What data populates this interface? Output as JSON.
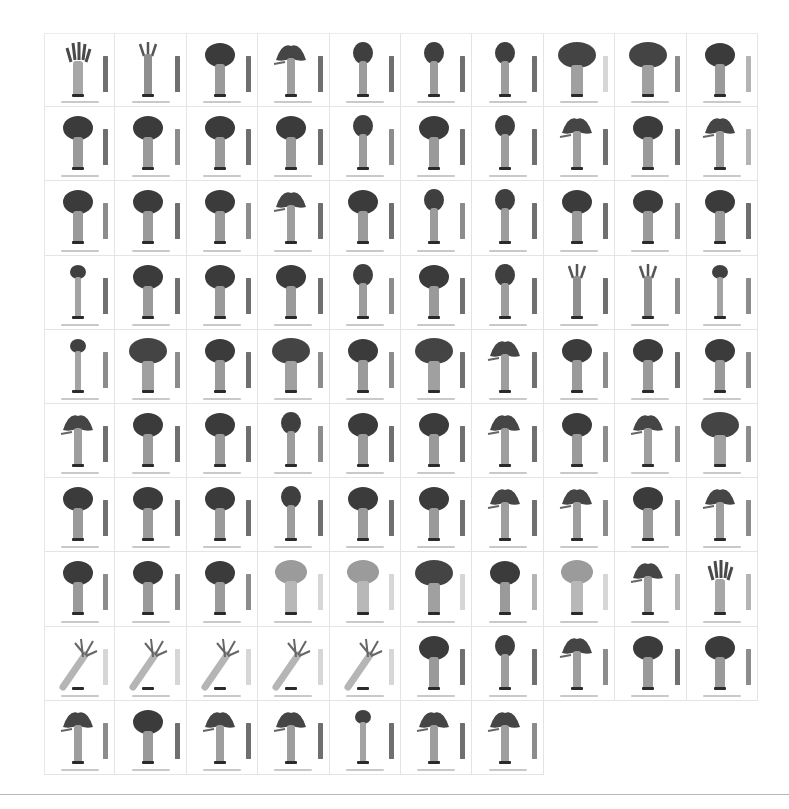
{
  "figure": {
    "layout": {
      "columns": 10,
      "rows": 10,
      "specimen_count": 97
    },
    "bar_shades": {
      "dark": "#6f6f6f",
      "mid": "#8c8c8c",
      "light": "#b4b4b4",
      "pale": "#d6d6d6"
    },
    "specimens": [
      {
        "shape": "fingered",
        "bar": "dark",
        "caption": ""
      },
      {
        "shape": "sparse",
        "bar": "dark",
        "caption": ""
      },
      {
        "shape": "dense",
        "bar": "dark",
        "caption": ""
      },
      {
        "shape": "leafy",
        "bar": "dark",
        "caption": ""
      },
      {
        "shape": "narrow",
        "bar": "dark",
        "caption": ""
      },
      {
        "shape": "narrow",
        "bar": "dark",
        "caption": ""
      },
      {
        "shape": "narrow",
        "bar": "dark",
        "caption": ""
      },
      {
        "shape": "wide",
        "bar": "pale",
        "caption": ""
      },
      {
        "shape": "wide",
        "bar": "mid",
        "caption": ""
      },
      {
        "shape": "dense",
        "bar": "light",
        "caption": ""
      },
      {
        "shape": "dense",
        "bar": "dark",
        "caption": ""
      },
      {
        "shape": "dense",
        "bar": "mid",
        "caption": ""
      },
      {
        "shape": "dense",
        "bar": "dark",
        "caption": ""
      },
      {
        "shape": "dense",
        "bar": "dark",
        "caption": ""
      },
      {
        "shape": "narrow",
        "bar": "mid",
        "caption": ""
      },
      {
        "shape": "dense",
        "bar": "dark",
        "caption": ""
      },
      {
        "shape": "narrow",
        "bar": "dark",
        "caption": ""
      },
      {
        "shape": "leafy",
        "bar": "dark",
        "caption": ""
      },
      {
        "shape": "dense",
        "bar": "dark",
        "caption": ""
      },
      {
        "shape": "leafy",
        "bar": "light",
        "caption": ""
      },
      {
        "shape": "dense",
        "bar": "mid",
        "caption": ""
      },
      {
        "shape": "dense",
        "bar": "dark",
        "caption": ""
      },
      {
        "shape": "dense",
        "bar": "mid",
        "caption": ""
      },
      {
        "shape": "leafy",
        "bar": "dark",
        "caption": ""
      },
      {
        "shape": "dense",
        "bar": "dark",
        "caption": ""
      },
      {
        "shape": "narrow",
        "bar": "mid",
        "caption": ""
      },
      {
        "shape": "narrow",
        "bar": "dark",
        "caption": ""
      },
      {
        "shape": "dense",
        "bar": "dark",
        "caption": ""
      },
      {
        "shape": "dense",
        "bar": "mid",
        "caption": ""
      },
      {
        "shape": "dense",
        "bar": "dark",
        "caption": ""
      },
      {
        "shape": "small",
        "bar": "dark",
        "caption": ""
      },
      {
        "shape": "dense",
        "bar": "dark",
        "caption": ""
      },
      {
        "shape": "dense",
        "bar": "dark",
        "caption": ""
      },
      {
        "shape": "dense",
        "bar": "dark",
        "caption": ""
      },
      {
        "shape": "narrow",
        "bar": "mid",
        "caption": ""
      },
      {
        "shape": "dense",
        "bar": "dark",
        "caption": ""
      },
      {
        "shape": "narrow",
        "bar": "dark",
        "caption": ""
      },
      {
        "shape": "sparse",
        "bar": "dark",
        "caption": ""
      },
      {
        "shape": "sparse",
        "bar": "mid",
        "caption": ""
      },
      {
        "shape": "small",
        "bar": "mid",
        "caption": ""
      },
      {
        "shape": "small",
        "bar": "mid",
        "caption": ""
      },
      {
        "shape": "wide",
        "bar": "mid",
        "caption": ""
      },
      {
        "shape": "dense",
        "bar": "dark",
        "caption": ""
      },
      {
        "shape": "wide",
        "bar": "mid",
        "caption": ""
      },
      {
        "shape": "dense",
        "bar": "mid",
        "caption": ""
      },
      {
        "shape": "wide",
        "bar": "dark",
        "caption": ""
      },
      {
        "shape": "leafy",
        "bar": "dark",
        "caption": ""
      },
      {
        "shape": "dense",
        "bar": "mid",
        "caption": ""
      },
      {
        "shape": "dense",
        "bar": "dark",
        "caption": ""
      },
      {
        "shape": "dense",
        "bar": "mid",
        "caption": ""
      },
      {
        "shape": "leafy",
        "bar": "dark",
        "caption": ""
      },
      {
        "shape": "dense",
        "bar": "dark",
        "caption": ""
      },
      {
        "shape": "dense",
        "bar": "dark",
        "caption": ""
      },
      {
        "shape": "narrow",
        "bar": "mid",
        "caption": ""
      },
      {
        "shape": "dense",
        "bar": "dark",
        "caption": ""
      },
      {
        "shape": "dense",
        "bar": "dark",
        "caption": ""
      },
      {
        "shape": "leafy",
        "bar": "dark",
        "caption": ""
      },
      {
        "shape": "dense",
        "bar": "mid",
        "caption": ""
      },
      {
        "shape": "leafy",
        "bar": "mid",
        "caption": ""
      },
      {
        "shape": "wide",
        "bar": "mid",
        "caption": ""
      },
      {
        "shape": "dense",
        "bar": "dark",
        "caption": ""
      },
      {
        "shape": "dense",
        "bar": "dark",
        "caption": ""
      },
      {
        "shape": "dense",
        "bar": "dark",
        "caption": ""
      },
      {
        "shape": "narrow",
        "bar": "dark",
        "caption": ""
      },
      {
        "shape": "dense",
        "bar": "dark",
        "caption": ""
      },
      {
        "shape": "dense",
        "bar": "dark",
        "caption": ""
      },
      {
        "shape": "leafy",
        "bar": "dark",
        "caption": ""
      },
      {
        "shape": "leafy",
        "bar": "mid",
        "caption": ""
      },
      {
        "shape": "dense",
        "bar": "mid",
        "caption": ""
      },
      {
        "shape": "leafy",
        "bar": "mid",
        "caption": ""
      },
      {
        "shape": "dense",
        "bar": "mid",
        "caption": ""
      },
      {
        "shape": "dense",
        "bar": "mid",
        "caption": ""
      },
      {
        "shape": "dense",
        "bar": "mid",
        "caption": ""
      },
      {
        "shape": "pale",
        "bar": "pale",
        "caption": ""
      },
      {
        "shape": "pale",
        "bar": "pale",
        "caption": ""
      },
      {
        "shape": "wide",
        "bar": "pale",
        "caption": ""
      },
      {
        "shape": "dense",
        "bar": "light",
        "caption": ""
      },
      {
        "shape": "pale",
        "bar": "pale",
        "caption": ""
      },
      {
        "shape": "leafy",
        "bar": "light",
        "caption": ""
      },
      {
        "shape": "fingered",
        "bar": "light",
        "caption": ""
      },
      {
        "shape": "stalky",
        "bar": "pale",
        "caption": ""
      },
      {
        "shape": "stalky",
        "bar": "pale",
        "caption": ""
      },
      {
        "shape": "stalky",
        "bar": "pale",
        "caption": ""
      },
      {
        "shape": "stalky",
        "bar": "pale",
        "caption": ""
      },
      {
        "shape": "stalky",
        "bar": "pale",
        "caption": ""
      },
      {
        "shape": "dense",
        "bar": "dark",
        "caption": ""
      },
      {
        "shape": "narrow",
        "bar": "dark",
        "caption": ""
      },
      {
        "shape": "leafy",
        "bar": "mid",
        "caption": ""
      },
      {
        "shape": "dense",
        "bar": "dark",
        "caption": ""
      },
      {
        "shape": "dense",
        "bar": "mid",
        "caption": ""
      },
      {
        "shape": "leafy",
        "bar": "mid",
        "caption": ""
      },
      {
        "shape": "dense",
        "bar": "dark",
        "caption": ""
      },
      {
        "shape": "leafy",
        "bar": "dark",
        "caption": ""
      },
      {
        "shape": "leafy",
        "bar": "dark",
        "caption": ""
      },
      {
        "shape": "small",
        "bar": "dark",
        "caption": ""
      },
      {
        "shape": "leafy",
        "bar": "dark",
        "caption": ""
      },
      {
        "shape": "leafy",
        "bar": "mid",
        "caption": ""
      }
    ]
  }
}
